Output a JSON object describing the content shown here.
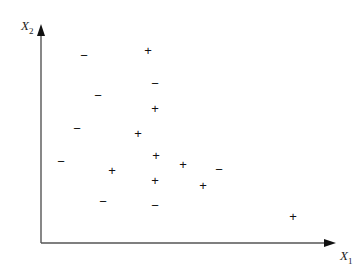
{
  "chart_data": {
    "type": "scatter",
    "title": "",
    "xlabel": "X1",
    "ylabel": "X2",
    "grid": false,
    "legend": null,
    "classes": [
      "+",
      "−"
    ],
    "points": [
      {
        "label": "+",
        "x": 148,
        "y": 51
      },
      {
        "label": "+",
        "x": 155,
        "y": 109
      },
      {
        "label": "+",
        "x": 138,
        "y": 134
      },
      {
        "label": "+",
        "x": 156,
        "y": 156
      },
      {
        "label": "+",
        "x": 112,
        "y": 171
      },
      {
        "label": "+",
        "x": 183,
        "y": 165
      },
      {
        "label": "+",
        "x": 155,
        "y": 181
      },
      {
        "label": "+",
        "x": 203,
        "y": 186
      },
      {
        "label": "+",
        "x": 293,
        "y": 217
      },
      {
        "label": "−",
        "x": 84,
        "y": 56
      },
      {
        "label": "−",
        "x": 155,
        "y": 84
      },
      {
        "label": "−",
        "x": 98,
        "y": 96
      },
      {
        "label": "−",
        "x": 77,
        "y": 129
      },
      {
        "label": "−",
        "x": 61,
        "y": 162
      },
      {
        "label": "−",
        "x": 219,
        "y": 170
      },
      {
        "label": "−",
        "x": 103,
        "y": 202
      },
      {
        "label": "−",
        "x": 155,
        "y": 206
      }
    ],
    "note": "coordinates are pixel positions in the 364x274 figure; no axis ticks shown"
  },
  "axes": {
    "x_label_main": "X",
    "x_label_sub": "1",
    "y_label_main": "X",
    "y_label_sub": "2"
  }
}
